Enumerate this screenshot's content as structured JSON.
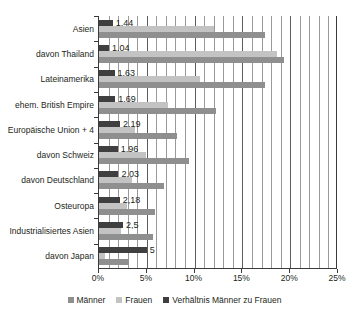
{
  "chart_data": {
    "type": "bar",
    "orientation": "horizontal",
    "title": "",
    "xlabel": "",
    "ylabel": "",
    "xlim": [
      0,
      25
    ],
    "xtick_labels": [
      "0%",
      "5%",
      "10%",
      "15%",
      "20%",
      "25%"
    ],
    "xtick_values": [
      0,
      5,
      10,
      15,
      20,
      25
    ],
    "grid": true,
    "grid_interval": 1,
    "legend_position": "bottom",
    "categories": [
      "Asien",
      "davon Thailand",
      "Lateinamerika",
      "ehem. British Empire",
      "Europäische Union + 4",
      "davon Schweiz",
      "davon Deutschland",
      "Osteuropa",
      "Industrialisiertes Asien",
      "davon Japan"
    ],
    "series": [
      {
        "name": "Verhältnis Männer zu Frauen",
        "color": "#3f3f3f",
        "values": [
          1.44,
          1.04,
          1.63,
          1.69,
          2.19,
          1.96,
          2.03,
          2.18,
          2.5,
          5
        ],
        "value_labels": [
          "1,44",
          "1,04",
          "1,63",
          "1,69",
          "2,19",
          "1,96",
          "2,03",
          "2,18",
          "2,5",
          "5"
        ]
      },
      {
        "name": "Frauen",
        "color": "#c3c3c3",
        "values": [
          12.0,
          18.6,
          10.6,
          7.2,
          3.8,
          4.9,
          3.5,
          2.9,
          2.3,
          0.6
        ]
      },
      {
        "name": "Männer",
        "color": "#8f8f8f",
        "values": [
          17.4,
          19.3,
          17.4,
          12.2,
          8.2,
          9.4,
          6.8,
          5.9,
          5.6,
          3.1
        ]
      }
    ],
    "legend_entries": [
      {
        "label": "Männer",
        "color": "#8f8f8f"
      },
      {
        "label": "Frauen",
        "color": "#c3c3c3"
      },
      {
        "label": "Verhältnis Männer zu Frauen",
        "color": "#3f3f3f"
      }
    ]
  }
}
